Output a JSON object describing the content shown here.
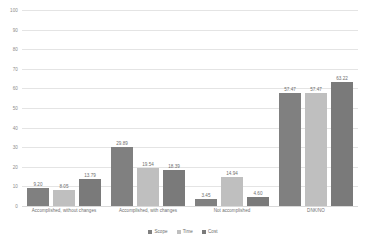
{
  "chart_data": {
    "type": "bar",
    "title": "",
    "subtitle": "",
    "xlabel": "",
    "ylabel": "",
    "ylim": [
      0,
      100
    ],
    "ytick_step": 10,
    "yticks": [
      "0",
      "10",
      "20",
      "30",
      "40",
      "50",
      "60",
      "70",
      "80",
      "90",
      "100"
    ],
    "grid": true,
    "legend_position": "bottom-center",
    "categories": [
      "Accomplished, without changes",
      "Accomplished, with changes",
      "Not accomplished",
      "DNK/NO"
    ],
    "series": [
      {
        "name": "Scope",
        "color": "#808080",
        "values": [
          9.2,
          29.89,
          3.45,
          57.47
        ],
        "labels": [
          "9.20",
          "29.89",
          "3.45",
          "57.47"
        ]
      },
      {
        "name": "Time",
        "color": "#bfbfbf",
        "values": [
          8.05,
          19.54,
          14.94,
          57.47
        ],
        "labels": [
          "8.05",
          "19.54",
          "14.94",
          "57.47"
        ]
      },
      {
        "name": "Cost",
        "color": "#7a7a7a",
        "values": [
          13.79,
          18.39,
          4.6,
          63.22
        ],
        "labels": [
          "13.79",
          "18.39",
          "4.60",
          "63.22"
        ]
      }
    ]
  },
  "colors": {
    "gridline": "#e4e4e4",
    "axis_text": "#8c8c8c",
    "label_text": "#6e6e6e",
    "background": "#ffffff"
  }
}
